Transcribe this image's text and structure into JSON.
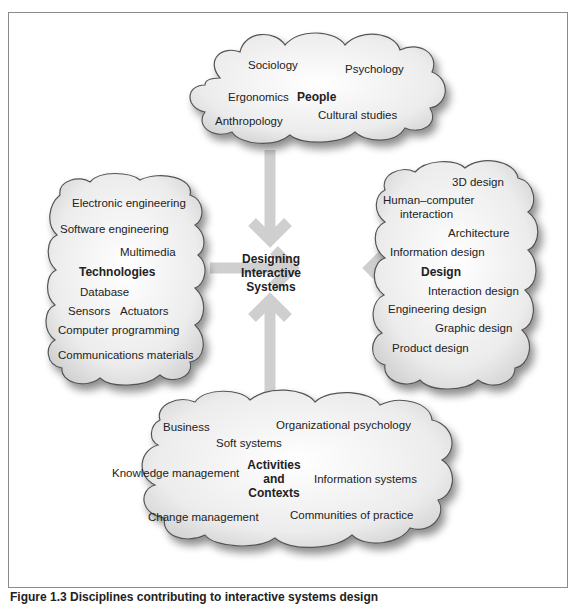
{
  "diagram": {
    "center": {
      "line1": "Designing",
      "line2": "Interactive",
      "line3": "Systems"
    },
    "people": {
      "title": "People",
      "items": [
        "Sociology",
        "Psychology",
        "Ergonomics",
        "Cultural studies",
        "Anthropology"
      ]
    },
    "technologies": {
      "title": "Technologies",
      "items": [
        "Electronic engineering",
        "Software engineering",
        "Multimedia",
        "Database",
        "Sensors",
        "Actuators",
        "Computer programming",
        "Communications materials"
      ]
    },
    "design": {
      "title": "Design",
      "items": [
        "3D design",
        "Human–computer",
        "interaction",
        "Architecture",
        "Information design",
        "Interaction design",
        "Engineering design",
        "Graphic design",
        "Product design"
      ]
    },
    "activities": {
      "title_line1": "Activities",
      "title_line2": "and",
      "title_line3": "Contexts",
      "items": [
        "Business",
        "Organizational psychology",
        "Soft systems",
        "Knowledge management",
        "Information systems",
        "Change management",
        "Communities of practice"
      ]
    },
    "colors": {
      "cloud_fill": "#e6e6e6",
      "cloud_stroke": "#555555",
      "arrow": "#cfcfcf",
      "frame": "#8a8a8a"
    }
  },
  "caption": "Figure 1.3 Disciplines contributing to interactive systems design"
}
